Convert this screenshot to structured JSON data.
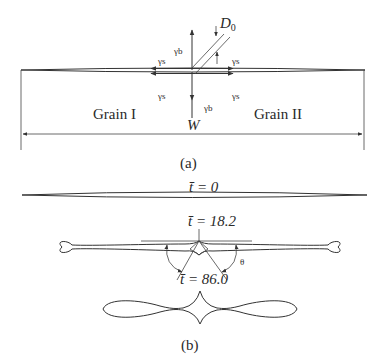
{
  "panel_a": {
    "caption": "(a)",
    "labels": {
      "grain_left": "Grain I",
      "grain_right": "Grain II",
      "width": "W",
      "groove_depth": "D",
      "groove_depth_sub": "0",
      "gamma_b_top": "γb",
      "gamma_b_bottom": "γb",
      "gamma_s_top_left": "γs",
      "gamma_s_top_right": "γs",
      "gamma_s_bottom_left": "γs",
      "gamma_s_bottom_right": "γs"
    }
  },
  "panel_b": {
    "caption": "(b)",
    "labels": {
      "t0": "t̄ = 0",
      "t1": "t̄ = 18.2",
      "t2": "t̄ = 86.0",
      "angle": "θ"
    }
  }
}
